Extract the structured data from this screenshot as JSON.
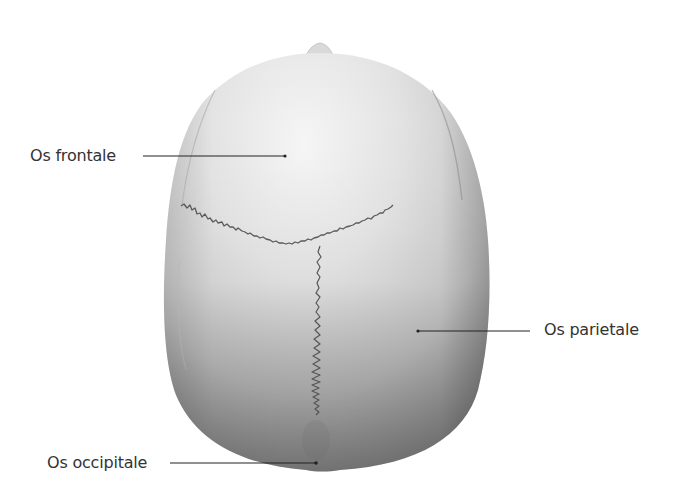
{
  "figure": {
    "labels": [
      {
        "id": "frontal",
        "text": "Os frontale"
      },
      {
        "id": "parietal",
        "text": "Os parietale"
      },
      {
        "id": "occipital",
        "text": "Os occipitale"
      }
    ]
  },
  "colors": {
    "background": "#ffffff",
    "label_text": "#333333",
    "leader_line": "#222222",
    "bone_light": "#f2f2f2",
    "bone_mid": "#c9c9c9",
    "bone_dark": "#8e8e8e",
    "suture": "#4a4a4a"
  }
}
